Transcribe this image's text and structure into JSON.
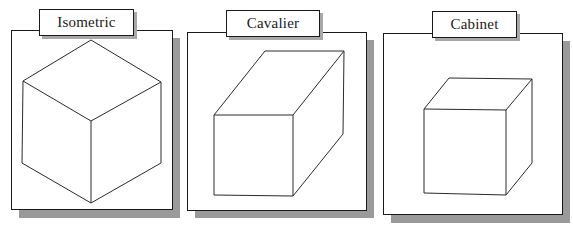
{
  "figure": {
    "panels": [
      {
        "id": "isometric",
        "label": "Isometric",
        "projection": "isometric",
        "cube_edges": "all visible faces: top rhombus, left and right parallelogram faces meeting at front vertical edge"
      },
      {
        "id": "cavalier",
        "label": "Cavalier",
        "projection": "cavalier",
        "cube_edges": "square front face, receding depth lines at full length drawn up and to the right"
      },
      {
        "id": "cabinet",
        "label": "Cabinet",
        "projection": "cabinet",
        "cube_edges": "square front face, receding depth lines at half length drawn up and to the right"
      }
    ],
    "colors": {
      "line": "#2a2a2a",
      "panel_border": "#1a1a1a",
      "shadow": "#9a9a9a",
      "background": "#ffffff"
    }
  }
}
